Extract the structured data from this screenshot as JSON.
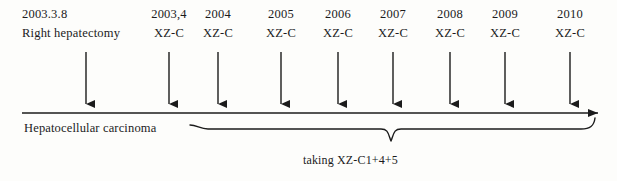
{
  "figure": {
    "type": "clinical-timeline",
    "diagnosis_label": "Hepatocellular carcinoma",
    "brace_caption": "taking XZ-C1+4+5",
    "line_color": "#1b1b1b",
    "background_color": "#fdfdfb"
  },
  "events": [
    {
      "year": "2003.3.8",
      "treatment": "Right hepatectomy",
      "arrow_x": 86,
      "label_left": 22,
      "wide": true
    },
    {
      "year": "2003,4",
      "treatment": "XZ-C",
      "arrow_x": 169,
      "label_left": 142,
      "wide": false
    },
    {
      "year": "2004",
      "treatment": "XZ-C",
      "arrow_x": 218,
      "label_left": 191,
      "wide": false
    },
    {
      "year": "2005",
      "treatment": "XZ-C",
      "arrow_x": 281,
      "label_left": 254,
      "wide": false
    },
    {
      "year": "2006",
      "treatment": "XZ-C",
      "arrow_x": 338,
      "label_left": 311,
      "wide": false
    },
    {
      "year": "2007",
      "treatment": "XZ-C",
      "arrow_x": 393,
      "label_left": 366,
      "wide": false
    },
    {
      "year": "2008",
      "treatment": "XZ-C",
      "arrow_x": 450,
      "label_left": 423,
      "wide": false
    },
    {
      "year": "2009",
      "treatment": "XZ-C",
      "arrow_x": 505,
      "label_left": 478,
      "wide": false
    },
    {
      "year": "2010",
      "treatment": "XZ-C",
      "arrow_x": 570,
      "label_left": 543,
      "wide": false
    }
  ]
}
